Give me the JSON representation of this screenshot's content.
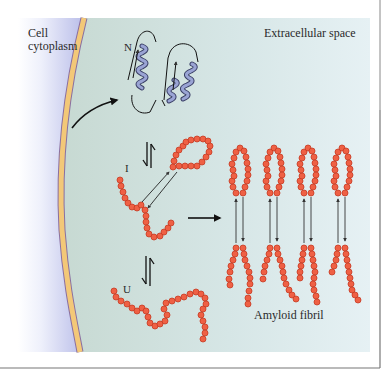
{
  "figure": {
    "regions": {
      "cytoplasm_label": "Cell cytoplasm",
      "extracellular_label": "Extracellular space"
    },
    "states": {
      "native": "N",
      "intermediate": "I",
      "unfolded": "U"
    },
    "product_label": "Amyloid fibril",
    "colors": {
      "cytoplasm": "#c9ccf0",
      "membrane": "#f3c878",
      "membrane_edge": "#8a6fa0",
      "extracellular": "#c8dad2",
      "chain": "#ef6044",
      "chain_edge": "#c73a22",
      "helix": "#8c97c8",
      "border": "#777777"
    },
    "fibril_count": 4
  }
}
